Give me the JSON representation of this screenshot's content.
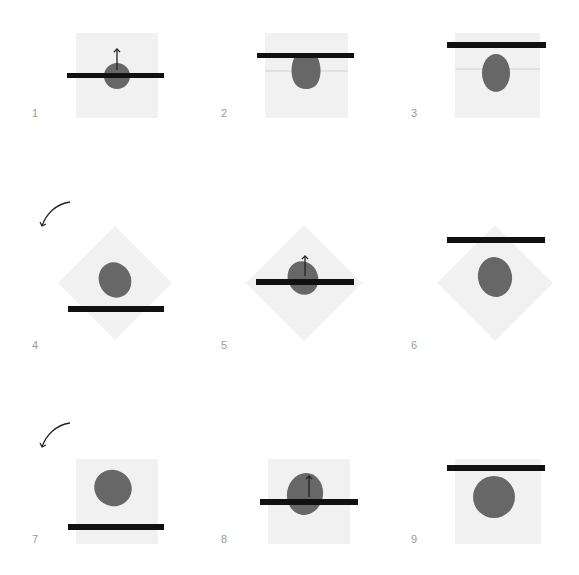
{
  "figure": {
    "title": "",
    "colors": {
      "background": "#ffffff",
      "frame": "#f1f1f1",
      "bar": "#111111",
      "blob": "#676767",
      "guide_line": "#dddddd",
      "arrow": "#222222",
      "label": "#9a9a9a"
    },
    "rotation_arrows": [
      {
        "row": 2,
        "icon": "curved-arrow-rotate-left-icon"
      },
      {
        "row": 3,
        "icon": "curved-arrow-rotate-left-icon"
      }
    ],
    "panels": [
      {
        "label": "1",
        "frame": "square",
        "bar_position": "through-center",
        "blob": "circle",
        "up_arrow": true,
        "guide_line": false
      },
      {
        "label": "2",
        "frame": "square",
        "bar_position": "upper",
        "blob": "drop",
        "up_arrow": false,
        "guide_line": true
      },
      {
        "label": "3",
        "frame": "square",
        "bar_position": "top",
        "blob": "egg",
        "up_arrow": false,
        "guide_line": true
      },
      {
        "label": "4",
        "frame": "diamond",
        "bar_position": "lower",
        "blob": "tilted-egg",
        "up_arrow": false,
        "guide_line": false
      },
      {
        "label": "5",
        "frame": "diamond",
        "bar_position": "through-center",
        "blob": "tilted-egg",
        "up_arrow": true,
        "guide_line": false
      },
      {
        "label": "6",
        "frame": "diamond",
        "bar_position": "top",
        "blob": "rounded-egg",
        "up_arrow": false,
        "guide_line": false
      },
      {
        "label": "7",
        "frame": "square",
        "bar_position": "lower",
        "blob": "rounded-blob",
        "up_arrow": false,
        "guide_line": false
      },
      {
        "label": "8",
        "frame": "square",
        "bar_position": "through-center",
        "blob": "rounded-blob",
        "up_arrow": true,
        "guide_line": false
      },
      {
        "label": "9",
        "frame": "square",
        "bar_position": "top",
        "blob": "circle",
        "up_arrow": false,
        "guide_line": false
      }
    ]
  }
}
